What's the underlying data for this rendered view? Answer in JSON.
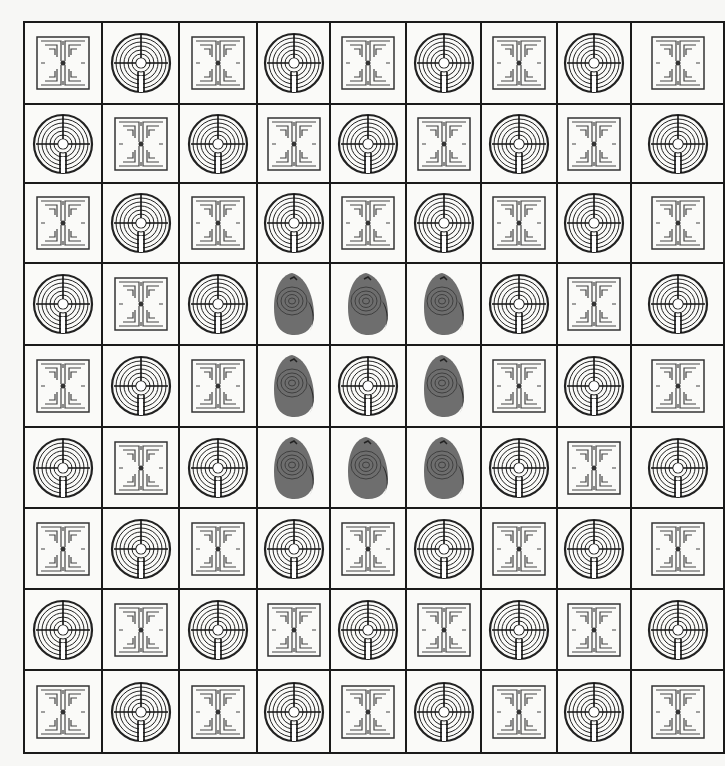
{
  "grid": {
    "rows": 9,
    "columns": 9,
    "legend": {
      "S": "square-labyrinth",
      "C": "circular-labyrinth",
      "R": "carved-stone-labyrinth"
    },
    "layout": [
      [
        "S",
        "C",
        "S",
        "C",
        "S",
        "C",
        "S",
        "C",
        "S"
      ],
      [
        "C",
        "S",
        "C",
        "S",
        "C",
        "S",
        "C",
        "S",
        "C"
      ],
      [
        "S",
        "C",
        "S",
        "C",
        "S",
        "C",
        "S",
        "C",
        "S"
      ],
      [
        "C",
        "S",
        "C",
        "R",
        "R",
        "R",
        "C",
        "S",
        "C"
      ],
      [
        "S",
        "C",
        "S",
        "R",
        "C",
        "R",
        "S",
        "C",
        "S"
      ],
      [
        "C",
        "S",
        "C",
        "R",
        "R",
        "R",
        "C",
        "S",
        "C"
      ],
      [
        "S",
        "C",
        "S",
        "C",
        "S",
        "C",
        "S",
        "C",
        "S"
      ],
      [
        "C",
        "S",
        "C",
        "S",
        "C",
        "S",
        "C",
        "S",
        "C"
      ],
      [
        "S",
        "C",
        "S",
        "C",
        "S",
        "C",
        "S",
        "C",
        "S"
      ]
    ]
  },
  "colors": {
    "ink": "#1a1a1a",
    "paper": "#fafaf8",
    "stone": "#6e6e6e"
  }
}
